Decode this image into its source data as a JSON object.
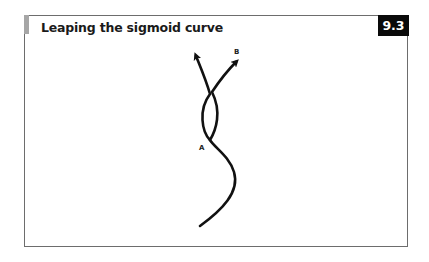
{
  "figure": {
    "title": "Leaping the sigmoid curve",
    "number": "9.3",
    "accent_color": "#a6a6a6",
    "badge_color": "#0a0a0a",
    "labels": {
      "a": "A",
      "b": "B"
    }
  }
}
